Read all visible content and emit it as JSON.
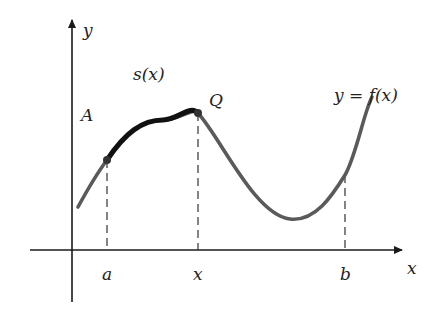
{
  "figure": {
    "type": "arc-length-diagram",
    "axes": {
      "x_label": "x",
      "y_label": "y"
    },
    "curve_label": "y = f(x)",
    "arc_label": "s(x)",
    "points": {
      "start_label": "A",
      "moving_label": "Q"
    },
    "tick_labels": {
      "a": "a",
      "x": "x",
      "b": "b"
    },
    "colors": {
      "axis": "#1a1a1a",
      "curve": "#5a5a5a",
      "arc": "#111111",
      "dash": "#333333"
    }
  }
}
